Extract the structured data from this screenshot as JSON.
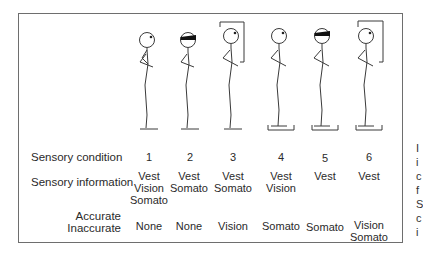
{
  "row_labels": {
    "condition": "Sensory condition",
    "information": "Sensory information",
    "accurate": "Accurate",
    "inaccurate": "Inaccurate"
  },
  "conditions": [
    {
      "number": "1",
      "eyes": "open",
      "visual_surround": false,
      "sway_platform": false,
      "accurate": [
        "Vest",
        "Vision",
        "Somato"
      ],
      "inaccurate": [
        "None"
      ]
    },
    {
      "number": "2",
      "eyes": "blindfolded",
      "visual_surround": false,
      "sway_platform": false,
      "accurate": [
        "Vest",
        "Somato"
      ],
      "inaccurate": [
        "None"
      ]
    },
    {
      "number": "3",
      "eyes": "open",
      "visual_surround": true,
      "sway_platform": false,
      "accurate": [
        "Vest",
        "Somato"
      ],
      "inaccurate": [
        "Vision"
      ]
    },
    {
      "number": "4",
      "eyes": "open",
      "visual_surround": false,
      "sway_platform": true,
      "accurate": [
        "Vest",
        "Vision"
      ],
      "inaccurate": [
        "Somato"
      ]
    },
    {
      "number": "5",
      "eyes": "blindfolded",
      "visual_surround": false,
      "sway_platform": true,
      "accurate": [
        "Vest"
      ],
      "inaccurate": [
        "Somato"
      ]
    },
    {
      "number": "6",
      "eyes": "open",
      "visual_surround": true,
      "sway_platform": true,
      "accurate": [
        "Vest"
      ],
      "inaccurate": [
        "Vision",
        "Somato"
      ]
    }
  ],
  "cells": {
    "c1": {
      "acc1": "Vest",
      "acc2": "Vision",
      "acc3": "Somato",
      "inacc1": "None",
      "inacc2": ""
    },
    "c2": {
      "acc1": "Vest",
      "acc2": "Somato",
      "acc3": "",
      "inacc1": "None",
      "inacc2": ""
    },
    "c3": {
      "acc1": "Vest",
      "acc2": "Somato",
      "acc3": "",
      "inacc1": "Vision",
      "inacc2": ""
    },
    "c4": {
      "acc1": "Vest",
      "acc2": "Vision",
      "acc3": "",
      "inacc1": "Somato",
      "inacc2": ""
    },
    "c5": {
      "acc1": "Vest",
      "acc2": "",
      "acc3": "",
      "inacc1": "Somato",
      "inacc2": ""
    },
    "c6": {
      "acc1": "Vest",
      "acc2": "",
      "acc3": "",
      "inacc1": "Vision",
      "inacc2": "Somato"
    }
  },
  "numbers": {
    "n1": "1",
    "n2": "2",
    "n3": "3",
    "n4": "4",
    "n5": "5",
    "n6": "6"
  },
  "cut_off_caption_letters": [
    "I",
    "i",
    "c",
    "f",
    "S",
    "c",
    "i"
  ]
}
